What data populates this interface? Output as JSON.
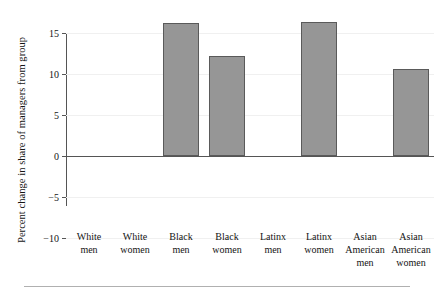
{
  "chart_data": {
    "type": "bar",
    "title": "",
    "xlabel": "",
    "ylabel": "Percent change in share of managers from group",
    "categories": [
      "White men",
      "White women",
      "Black men",
      "Black women",
      "Latinx men",
      "Latinx women",
      "Asian American men",
      "Asian American women"
    ],
    "category_lines": [
      [
        "White",
        "men"
      ],
      [
        "White",
        "women"
      ],
      [
        "Black",
        "men"
      ],
      [
        "Black",
        "women"
      ],
      [
        "Latinx",
        "men"
      ],
      [
        "Latinx",
        "women"
      ],
      [
        "Asian",
        "American",
        "men"
      ],
      [
        "Asian",
        "American",
        "women"
      ]
    ],
    "values": [
      0,
      0,
      16.2,
      12.2,
      0,
      16.4,
      0,
      10.6
    ],
    "ylim": [
      -10,
      15
    ],
    "yticks": [
      15,
      10,
      5,
      0,
      -5,
      -10
    ],
    "ytick_labels": [
      "15",
      "10",
      "5",
      "0",
      "−5",
      "−10"
    ],
    "grid": true,
    "grid_axis": "y",
    "legend": "none",
    "bar_color": "#969696",
    "bar_edge_color": "#5a5a5a",
    "gridline_color": "#f0f0f0",
    "axis_color": "#555555"
  }
}
